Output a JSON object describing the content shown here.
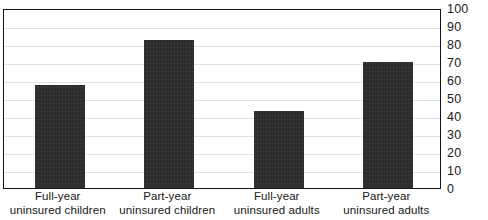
{
  "chart_data": {
    "type": "bar",
    "title": "",
    "xlabel": "",
    "ylabel": "",
    "ylim": [
      0,
      100
    ],
    "ytick_step": 10,
    "yticks": [
      100,
      90,
      80,
      70,
      60,
      50,
      40,
      30,
      20,
      10,
      0
    ],
    "grid": true,
    "axis_position": "right",
    "legend": "none",
    "categories": [
      "Full-year uninsured children",
      "Part-year uninsured children",
      "Full-year uninsured adults",
      "Part-year uninsured adults"
    ],
    "category_lines": [
      [
        "Full-year",
        "uninsured children"
      ],
      [
        "Part-year",
        "uninsured children"
      ],
      [
        "Full-year",
        "uninsured adults"
      ],
      [
        "Part-year",
        "uninsured adults"
      ]
    ],
    "values": [
      57,
      82,
      43,
      70
    ],
    "bar_color": "#2b2b2b",
    "grid_color": "#e2e2e2",
    "frame_color": "#131313",
    "background_color": "#ffffff"
  },
  "title_remnant": ""
}
